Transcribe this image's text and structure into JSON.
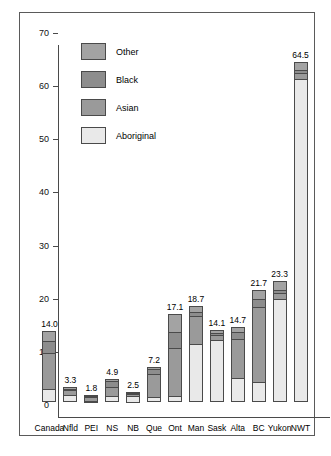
{
  "chart_data": {
    "type": "bar",
    "subtype": "stacked-vertical",
    "title": "",
    "xlabel": "",
    "ylabel": "",
    "ylim": [
      0,
      70
    ],
    "ytick_step": 10,
    "yticks": [
      0,
      10,
      20,
      30,
      40,
      50,
      60,
      70
    ],
    "grid": false,
    "legend_position": "top-left inside plot",
    "categories": [
      "Canada",
      "Nfld",
      "PEI",
      "NS",
      "NB",
      "Que",
      "Ont",
      "Man",
      "Sask",
      "Alta",
      "BC",
      "Yukon",
      "NWT"
    ],
    "series": [
      {
        "name": "Aboriginal",
        "color": "#e9e9e9",
        "values": [
          2.5,
          1.4,
          0.5,
          1.2,
          1.3,
          1.0,
          1.1,
          11.0,
          11.6,
          4.6,
          3.8,
          19.3,
          60.8
        ]
      },
      {
        "name": "Asian",
        "color": "#9a9a9a",
        "values": [
          7.0,
          1.0,
          0.8,
          1.9,
          0.6,
          4.4,
          9.2,
          5.3,
          1.2,
          7.5,
          14.3,
          1.4,
          1.3
        ]
      },
      {
        "name": "Black",
        "color": "#8d8d8d",
        "values": [
          2.4,
          0.5,
          0.2,
          1.2,
          0.3,
          1.2,
          3.3,
          1.1,
          0.5,
          1.5,
          1.6,
          0.8,
          0.7
        ]
      },
      {
        "name": "Other",
        "color": "#a3a3a3",
        "values": [
          2.1,
          0.4,
          0.3,
          0.6,
          0.3,
          0.6,
          3.5,
          1.3,
          0.8,
          1.1,
          2.0,
          1.8,
          1.7
        ]
      }
    ],
    "totals": [
      14.0,
      3.3,
      1.8,
      4.9,
      2.5,
      7.2,
      17.1,
      18.7,
      14.1,
      14.7,
      21.7,
      23.3,
      64.5
    ],
    "total_labels": [
      "14.0",
      "3.3",
      "1.8",
      "4.9",
      "2.5",
      "7.2",
      "17.1",
      "18.7",
      "14.1",
      "14.7",
      "21.7",
      "23.3",
      "64.5"
    ]
  },
  "legend": {
    "items": [
      {
        "label": "Other",
        "color": "#a3a3a3"
      },
      {
        "label": "Black",
        "color": "#8d8d8d"
      },
      {
        "label": "Asian",
        "color": "#9a9a9a"
      },
      {
        "label": "Aboriginal",
        "color": "#e9e9e9"
      }
    ]
  },
  "axis": {
    "y_tick_labels": [
      "70",
      "60",
      "50",
      "40",
      "30",
      "20",
      "10",
      "0"
    ]
  }
}
